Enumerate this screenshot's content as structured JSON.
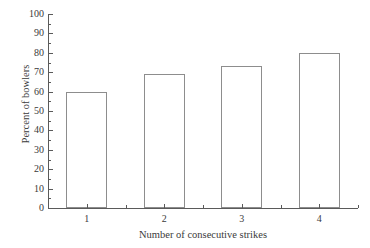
{
  "chart_data": {
    "type": "bar",
    "title": "",
    "subtitle": "",
    "xlabel": "Number of consecutive strikes",
    "ylabel": "Percent of bowlers",
    "categories": [
      "1",
      "2",
      "3",
      "4"
    ],
    "values": [
      60,
      69,
      73,
      80
    ],
    "series": [
      {
        "name": "Percent of bowlers",
        "values": [
          60,
          69,
          73,
          80
        ]
      }
    ],
    "ylim": [
      0,
      100
    ],
    "ytick_labels": [
      "0",
      "10",
      "20",
      "30",
      "40",
      "50",
      "60",
      "70",
      "80",
      "90",
      "100"
    ],
    "ytick_values": [
      0,
      10,
      20,
      30,
      40,
      50,
      60,
      70,
      80,
      90,
      100
    ],
    "yminor_tick_values": [
      5,
      15,
      25,
      35,
      45,
      55,
      65,
      75,
      85,
      95
    ],
    "xtick_labels": [
      "1",
      "2",
      "3",
      "4"
    ],
    "grid": false,
    "legend": false,
    "legend_position": "none",
    "bar_fill_color": "#ffffff",
    "bar_edge_color": "#8d8d8d",
    "axis_color": "#5a5a5a",
    "text_color": "#3a3a3a",
    "background_color": "#ffffff",
    "annotations": []
  }
}
